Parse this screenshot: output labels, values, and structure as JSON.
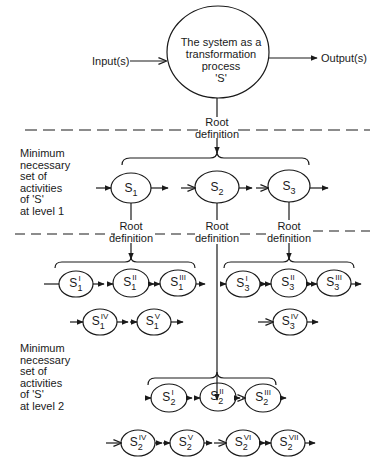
{
  "main_process": {
    "text": "The system as a\ntransformation\nprocess\n'S'",
    "input_label": "Input(s)",
    "output_label": "Output(s)"
  },
  "root_definition_label": "Root\ndefinition",
  "level1": {
    "side_label": "Minimum\nnecessary\nset of\nactivities\nof 'S'\nat level 1",
    "nodes": [
      {
        "base": "S",
        "sub": "1",
        "sup": ""
      },
      {
        "base": "S",
        "sub": "2",
        "sup": ""
      },
      {
        "base": "S",
        "sub": "3",
        "sup": ""
      }
    ]
  },
  "level1_root_labels": [
    "Root definition",
    "Root definition",
    "Root definition"
  ],
  "s1_subsystems": [
    {
      "base": "S",
      "sub": "1",
      "sup": "I"
    },
    {
      "base": "S",
      "sub": "1",
      "sup": "II"
    },
    {
      "base": "S",
      "sub": "1",
      "sup": "III"
    },
    {
      "base": "S",
      "sub": "1",
      "sup": "IV"
    },
    {
      "base": "S",
      "sub": "1",
      "sup": "V"
    }
  ],
  "s3_subsystems": [
    {
      "base": "S",
      "sub": "3",
      "sup": "I"
    },
    {
      "base": "S",
      "sub": "3",
      "sup": "II"
    },
    {
      "base": "S",
      "sub": "3",
      "sup": "III"
    },
    {
      "base": "S",
      "sub": "3",
      "sup": "IV"
    }
  ],
  "level2": {
    "side_label": "Minimum\nnecessary\nset of\nactivities\nof 'S'\nat level 2",
    "nodes": [
      {
        "base": "S",
        "sub": "2",
        "sup": "I"
      },
      {
        "base": "S",
        "sub": "2",
        "sup": "II"
      },
      {
        "base": "S",
        "sub": "2",
        "sup": "III"
      },
      {
        "base": "S",
        "sub": "2",
        "sup": "IV"
      },
      {
        "base": "S",
        "sub": "2",
        "sup": "V"
      },
      {
        "base": "S",
        "sub": "2",
        "sup": "VI"
      },
      {
        "base": "S",
        "sub": "2",
        "sup": "VII"
      }
    ]
  },
  "colors": {
    "ink": "#1a1a1a",
    "background": "#ffffff"
  }
}
